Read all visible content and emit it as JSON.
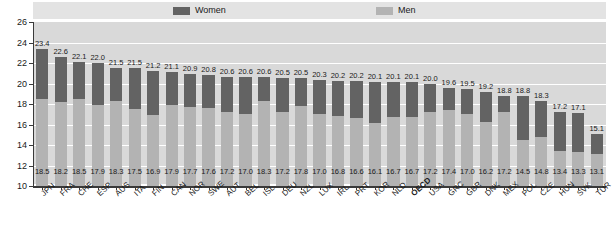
{
  "legend": {
    "women_label": "Women",
    "men_label": "Men",
    "women_color": "#636363",
    "men_color": "#b3b3b3"
  },
  "axis": {
    "y_ticks": [
      "26",
      "24",
      "22",
      "20",
      "18",
      "16",
      "14",
      "12",
      "10"
    ]
  },
  "chart_data": {
    "type": "bar",
    "subtype": "stacked",
    "title": "",
    "xlabel": "",
    "ylabel": "",
    "ylim": [
      10,
      26
    ],
    "ytick_step": 2,
    "grid": true,
    "legend_position": "top",
    "highlight_category": "OECD",
    "categories": [
      "JPN",
      "FRA",
      "CHE",
      "ESP",
      "AUS",
      "ITA",
      "FIN",
      "CAN",
      "NOR",
      "SWE",
      "AUT",
      "BEL",
      "ISL",
      "DEU",
      "NZL",
      "LUX",
      "IRL",
      "PRT",
      "KOR",
      "NLD",
      "OECD",
      "USA",
      "GRC",
      "GBR",
      "DNK",
      "MEX",
      "POL",
      "CZE",
      "HUN",
      "SVK",
      "TUR"
    ],
    "series": [
      {
        "name": "Women",
        "color": "#636363",
        "values": [
          23.4,
          22.6,
          22.1,
          22.0,
          21.5,
          21.5,
          21.2,
          21.1,
          20.9,
          20.8,
          20.6,
          20.6,
          20.6,
          20.5,
          20.5,
          20.3,
          20.2,
          20.2,
          20.1,
          20.1,
          20.1,
          20.0,
          19.6,
          19.5,
          19.2,
          18.8,
          18.8,
          18.3,
          17.2,
          17.1,
          15.1
        ]
      },
      {
        "name": "Men",
        "color": "#b3b3b3",
        "values": [
          18.5,
          18.2,
          18.5,
          17.9,
          18.3,
          17.5,
          16.9,
          17.9,
          17.7,
          17.6,
          17.2,
          17.0,
          18.3,
          17.2,
          17.8,
          17.0,
          16.8,
          16.6,
          16.1,
          16.7,
          16.7,
          17.2,
          17.4,
          17.0,
          16.2,
          17.2,
          14.5,
          14.8,
          13.4,
          13.3,
          13.1
        ]
      }
    ]
  }
}
